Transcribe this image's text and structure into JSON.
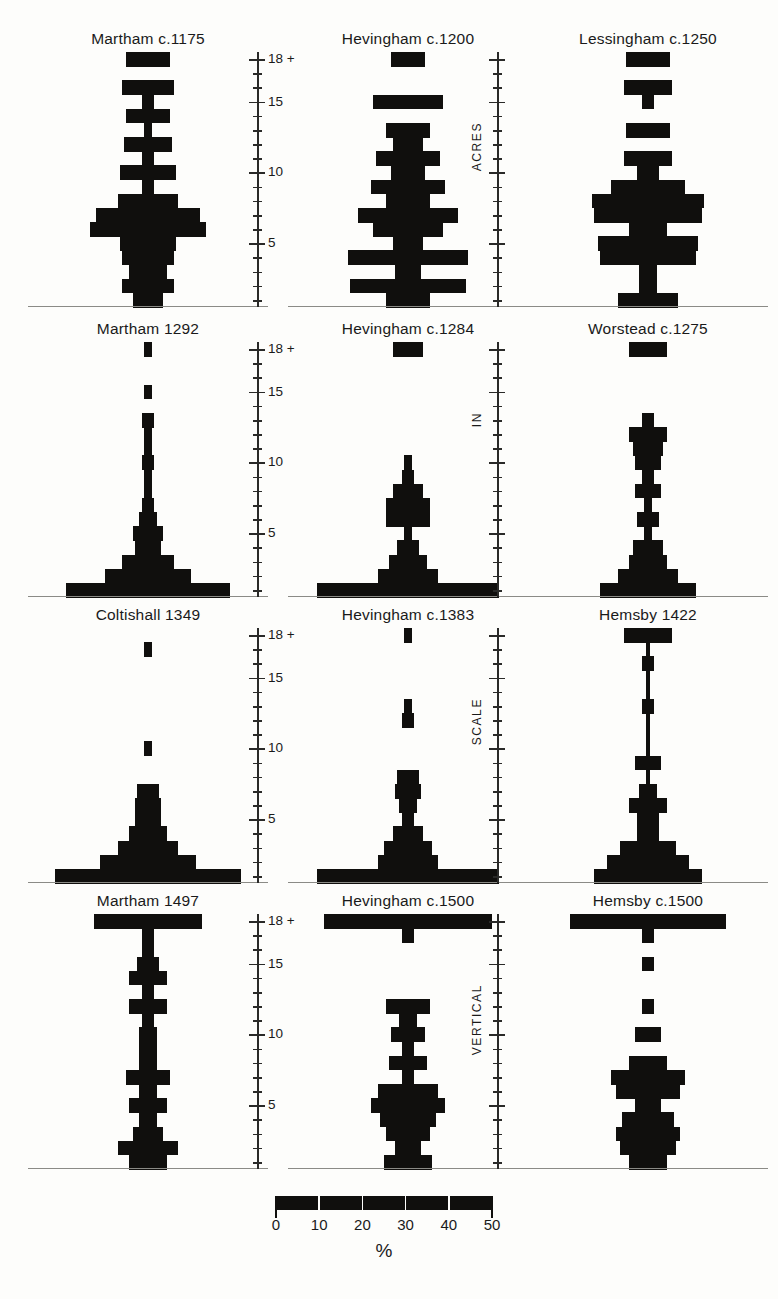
{
  "figure": {
    "axis": {
      "label_top": "18 +",
      "labels": [
        "18 +",
        "15",
        "10",
        "5"
      ],
      "vertical_titles": [
        "ACRES",
        "IN",
        "SCALE",
        "VERTICAL"
      ],
      "tick_values": [
        18,
        17,
        16,
        15,
        14,
        13,
        12,
        11,
        10,
        9,
        8,
        7,
        6,
        5,
        4,
        3,
        2,
        1
      ],
      "major_ticks": [
        18,
        15,
        10,
        5
      ]
    },
    "legend": {
      "ticks": [
        "0",
        "10",
        "20",
        "30",
        "40",
        "50"
      ],
      "unit": "%",
      "bar_color": "#100f0d",
      "max": 50
    }
  },
  "chart_data": [
    {
      "type": "bar",
      "title": "Martham  c.1175",
      "row": 0,
      "col": 0,
      "xlabel": "%",
      "ylabel": "ACRES",
      "ylim": [
        1,
        18
      ],
      "xlim": [
        0,
        50
      ],
      "categories": [
        18,
        17,
        16,
        15,
        14,
        13,
        12,
        11,
        10,
        9,
        8,
        7,
        6,
        5,
        4,
        3,
        2,
        1
      ],
      "values": [
        10,
        0,
        12,
        3,
        10,
        2,
        11,
        3,
        13,
        3,
        14,
        24,
        27,
        13,
        12,
        9,
        12,
        7
      ]
    },
    {
      "type": "bar",
      "title": "Hevingham  c.1200",
      "row": 0,
      "col": 1,
      "xlabel": "%",
      "ylabel": "ACRES",
      "ylim": [
        1,
        18
      ],
      "xlim": [
        0,
        50
      ],
      "categories": [
        18,
        17,
        16,
        15,
        14,
        13,
        12,
        11,
        10,
        9,
        8,
        7,
        6,
        5,
        4,
        3,
        2,
        1
      ],
      "values": [
        8,
        0,
        0,
        16,
        0,
        10,
        7,
        15,
        8,
        17,
        10,
        23,
        16,
        7,
        28,
        6,
        27,
        10
      ]
    },
    {
      "type": "bar",
      "title": "Lessingham  c.1250",
      "row": 0,
      "col": 2,
      "xlabel": "%",
      "ylabel": "ACRES",
      "ylim": [
        1,
        18
      ],
      "xlim": [
        0,
        50
      ],
      "categories": [
        18,
        17,
        16,
        15,
        14,
        13,
        12,
        11,
        10,
        9,
        8,
        7,
        6,
        5,
        4,
        3,
        2,
        1
      ],
      "values": [
        10,
        0,
        11,
        3,
        0,
        10,
        0,
        11,
        5,
        17,
        26,
        25,
        9,
        23,
        22,
        4,
        4,
        14
      ]
    },
    {
      "type": "bar",
      "title": "Martham 1292",
      "row": 1,
      "col": 0,
      "xlabel": "%",
      "ylabel": "IN",
      "ylim": [
        1,
        18
      ],
      "xlim": [
        0,
        50
      ],
      "categories": [
        18,
        17,
        16,
        15,
        14,
        13,
        12,
        11,
        10,
        9,
        8,
        7,
        6,
        5,
        4,
        3,
        2,
        1
      ],
      "values": [
        2,
        0,
        0,
        2,
        0,
        3,
        2,
        2,
        3,
        2,
        2,
        3,
        4,
        7,
        6,
        12,
        20,
        38
      ]
    },
    {
      "type": "bar",
      "title": "Hevingham  c.1284",
      "row": 1,
      "col": 1,
      "xlabel": "%",
      "ylabel": "IN",
      "ylim": [
        1,
        18
      ],
      "xlim": [
        0,
        50
      ],
      "categories": [
        18,
        17,
        16,
        15,
        14,
        13,
        12,
        11,
        10,
        9,
        8,
        7,
        6,
        5,
        4,
        3,
        2,
        1
      ],
      "values": [
        7,
        0,
        0,
        0,
        0,
        0,
        0,
        0,
        2,
        3,
        7,
        10,
        10,
        2,
        5,
        9,
        14,
        42
      ]
    },
    {
      "type": "bar",
      "title": "Worstead c.1275",
      "row": 1,
      "col": 2,
      "xlabel": "%",
      "ylabel": "IN",
      "ylim": [
        1,
        18
      ],
      "xlim": [
        0,
        50
      ],
      "categories": [
        18,
        17,
        16,
        15,
        14,
        13,
        12,
        11,
        10,
        9,
        8,
        7,
        6,
        5,
        4,
        3,
        2,
        1
      ],
      "values": [
        9,
        0,
        0,
        0,
        0,
        3,
        9,
        7,
        6,
        3,
        6,
        2,
        5,
        2,
        7,
        9,
        14,
        22
      ]
    },
    {
      "type": "bar",
      "title": "Coltishall 1349",
      "row": 2,
      "col": 0,
      "xlabel": "%",
      "ylabel": "SCALE",
      "ylim": [
        1,
        18
      ],
      "xlim": [
        0,
        50
      ],
      "categories": [
        18,
        17,
        16,
        15,
        14,
        13,
        12,
        11,
        10,
        9,
        8,
        7,
        6,
        5,
        4,
        3,
        2,
        1
      ],
      "values": [
        0,
        2,
        0,
        0,
        0,
        0,
        0,
        0,
        2,
        0,
        0,
        5,
        6,
        6,
        9,
        14,
        22,
        43
      ]
    },
    {
      "type": "bar",
      "title": "Hevingham  c.1383",
      "row": 2,
      "col": 1,
      "xlabel": "%",
      "ylabel": "SCALE",
      "ylim": [
        1,
        18
      ],
      "xlim": [
        0,
        50
      ],
      "categories": [
        18,
        17,
        16,
        15,
        14,
        13,
        12,
        11,
        10,
        9,
        8,
        7,
        6,
        5,
        4,
        3,
        2,
        1
      ],
      "values": [
        2,
        0,
        0,
        0,
        0,
        2,
        3,
        0,
        0,
        0,
        5,
        6,
        4,
        3,
        7,
        11,
        14,
        42
      ]
    },
    {
      "type": "bar",
      "title": "Hemsby 1422",
      "row": 2,
      "col": 2,
      "xlabel": "%",
      "ylabel": "SCALE",
      "ylim": [
        1,
        18
      ],
      "xlim": [
        0,
        50
      ],
      "categories": [
        18,
        17,
        16,
        15,
        14,
        13,
        12,
        11,
        10,
        9,
        8,
        7,
        6,
        5,
        4,
        3,
        2,
        1
      ],
      "values": [
        11,
        1,
        3,
        1,
        1,
        3,
        1,
        1,
        1,
        6,
        1,
        4,
        9,
        5,
        5,
        13,
        19,
        25
      ]
    },
    {
      "type": "bar",
      "title": "Martham 1497",
      "row": 3,
      "col": 0,
      "xlabel": "%",
      "ylabel": "VERTICAL",
      "ylim": [
        1,
        18
      ],
      "xlim": [
        0,
        50
      ],
      "categories": [
        18,
        17,
        16,
        15,
        14,
        13,
        12,
        11,
        10,
        9,
        8,
        7,
        6,
        5,
        4,
        3,
        2,
        1
      ],
      "values": [
        25,
        3,
        3,
        5,
        9,
        3,
        9,
        3,
        4,
        4,
        4,
        10,
        4,
        9,
        4,
        7,
        14,
        9
      ]
    },
    {
      "type": "bar",
      "title": "Hevingham  c.1500",
      "row": 3,
      "col": 1,
      "xlabel": "%",
      "ylabel": "VERTICAL",
      "ylim": [
        1,
        18
      ],
      "xlim": [
        0,
        50
      ],
      "categories": [
        18,
        17,
        16,
        15,
        14,
        13,
        12,
        11,
        10,
        9,
        8,
        7,
        6,
        5,
        4,
        3,
        2,
        1
      ],
      "values": [
        39,
        3,
        0,
        0,
        0,
        0,
        10,
        4,
        8,
        3,
        9,
        3,
        14,
        17,
        13,
        10,
        6,
        11
      ]
    },
    {
      "type": "bar",
      "title": "Hemsby  c.1500",
      "row": 3,
      "col": 2,
      "xlabel": "%",
      "ylabel": "VERTICAL",
      "ylim": [
        1,
        18
      ],
      "xlim": [
        0,
        50
      ],
      "categories": [
        18,
        17,
        16,
        15,
        14,
        13,
        12,
        11,
        10,
        9,
        8,
        7,
        6,
        5,
        4,
        3,
        2,
        1
      ],
      "values": [
        36,
        3,
        0,
        3,
        0,
        0,
        3,
        0,
        6,
        0,
        9,
        17,
        15,
        6,
        12,
        15,
        13,
        9
      ]
    }
  ]
}
